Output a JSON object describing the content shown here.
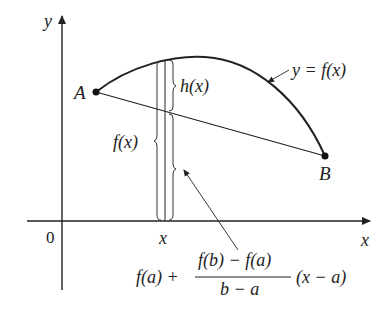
{
  "diagram": {
    "axes": {
      "x_label": "x",
      "y_label": "y",
      "origin_label": "0"
    },
    "points": {
      "A": "A",
      "B": "B"
    },
    "curve_label": "y = f(x)",
    "tick_label_x": "x",
    "brace_labels": {
      "h": "h(x)",
      "f": "f(x)"
    },
    "secant_formula": {
      "prefix": "f(a) +",
      "numerator": "f(b) − f(a)",
      "denominator": "b − a",
      "suffix": "(x − a)"
    },
    "colors": {
      "ink": "#222222",
      "background": "#ffffff"
    }
  }
}
